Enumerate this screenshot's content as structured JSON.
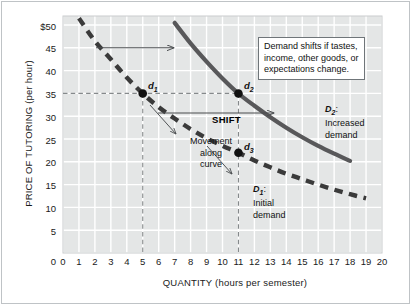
{
  "chart_data": {
    "type": "line",
    "title": "",
    "xlabel": "QUANTITY (hours per semester)",
    "ylabel": "PRICE OF TUTORING (per hour)",
    "xlim": [
      0,
      20
    ],
    "ylim": [
      0,
      52
    ],
    "grid": true,
    "legend_position": "inline-annotations",
    "xticks": [
      "0",
      "1",
      "2",
      "3",
      "4",
      "5",
      "6",
      "7",
      "8",
      "9",
      "10",
      "11",
      "12",
      "13",
      "14",
      "15",
      "16",
      "17",
      "18",
      "19",
      "20"
    ],
    "yticks": [
      "0",
      "5",
      "10",
      "15",
      "20",
      "25",
      "30",
      "35",
      "40",
      "45",
      "$50"
    ],
    "series": [
      {
        "name": "D1: Initial demand",
        "style": "dashed",
        "color": "#3a3a3a",
        "x": [
          1,
          2,
          3,
          4,
          5,
          6,
          7,
          8,
          9,
          10,
          11,
          12,
          13,
          14,
          15,
          16,
          17,
          18,
          19
        ],
        "y": [
          51.5,
          46.5,
          42.5,
          38.5,
          35.0,
          32.0,
          29.5,
          27.2,
          25.2,
          23.5,
          22.0,
          20.3,
          18.8,
          17.4,
          16.2,
          15.0,
          13.9,
          12.9,
          12.0
        ]
      },
      {
        "name": "D2: Increased demand",
        "style": "solid",
        "color": "#58585a",
        "x": [
          7,
          8,
          9,
          10,
          11,
          12,
          13,
          14,
          15,
          16,
          17,
          18
        ],
        "y": [
          50.5,
          46.0,
          42.0,
          38.3,
          35.0,
          32.3,
          29.8,
          27.5,
          25.4,
          23.5,
          21.8,
          20.2
        ]
      }
    ],
    "points": [
      {
        "id": "d1",
        "label": "d",
        "sub": "1",
        "x": 5,
        "y": 35
      },
      {
        "id": "d2",
        "label": "d",
        "sub": "2",
        "x": 11,
        "y": 35
      },
      {
        "id": "d3",
        "label": "d",
        "sub": "3",
        "x": 11,
        "y": 22
      }
    ],
    "guide_lines": [
      {
        "type": "horizontal",
        "y": 35,
        "from_x": 0,
        "to_x": 11
      },
      {
        "type": "vertical",
        "x": 5,
        "from_y": 0,
        "to_y": 35
      },
      {
        "type": "vertical",
        "x": 11,
        "from_y": 0,
        "to_y": 35
      }
    ],
    "annotations": [
      {
        "id": "callout",
        "text_lines": [
          "Demand shifts if tastes,",
          "income, other goods, or",
          "expectations change."
        ]
      },
      {
        "id": "shift",
        "text": "SHIFT"
      },
      {
        "id": "movement",
        "text_lines": [
          "Movement",
          "along",
          "curve"
        ]
      },
      {
        "id": "d2-label",
        "name": "D",
        "sub": "2",
        "text_lines": [
          "Increased",
          "demand"
        ]
      },
      {
        "id": "d1-label",
        "name": "D",
        "sub": "1",
        "text_lines": [
          "Initial",
          "demand"
        ]
      }
    ],
    "arrows": [
      {
        "id": "top-shift-arrow",
        "from": [
          2.1,
          47.8
        ],
        "to": [
          7.1,
          47.8
        ]
      },
      {
        "id": "shift-arrow",
        "from": [
          6.0,
          30.6
        ],
        "to": [
          13.2,
          30.6
        ]
      },
      {
        "id": "movement-arrow",
        "from": [
          5.4,
          32.3
        ],
        "to": [
          7.2,
          26.0
        ]
      },
      {
        "id": "movement-arrow-2",
        "from": [
          9.7,
          24.4
        ],
        "to": [
          12.3,
          19.3
        ]
      }
    ],
    "colors": {
      "plot_background": "#e4e6e6",
      "gridline": "#ffffff",
      "d1_curve": "#3a3a3a",
      "d2_curve": "#58585a",
      "point_marker": "#111111",
      "guide_line": "#8a8d8f",
      "frame": "#bfc3c6",
      "text": "#111111"
    }
  },
  "axes": {
    "y_title": "PRICE OF TUTORING (per hour)",
    "x_title": "QUANTITY (hours per semester)",
    "y_ticks": [
      "$50",
      "45",
      "40",
      "35",
      "30",
      "25",
      "20",
      "15",
      "10",
      "5",
      "0"
    ],
    "x_ticks": [
      "0",
      "1",
      "2",
      "3",
      "4",
      "5",
      "6",
      "7",
      "8",
      "9",
      "10",
      "11",
      "12",
      "13",
      "14",
      "15",
      "16",
      "17",
      "18",
      "19",
      "20"
    ]
  },
  "callout": {
    "line1": "Demand shifts if tastes,",
    "line2": "income, other goods, or",
    "line3": "expectations change."
  },
  "labels": {
    "shift": "SHIFT",
    "movement_line1": "Movement",
    "movement_line2": "along",
    "movement_line3": "curve",
    "d2_name": "D",
    "d2_sub": "2",
    "d2_colon": ":",
    "d2_line1": "Increased",
    "d2_line2": "demand",
    "d1_name": "D",
    "d1_sub": "1",
    "d1_colon": ":",
    "d1_line1": "Initial",
    "d1_line2": "demand",
    "pt_d1": "d",
    "pt_d1_sub": "1",
    "pt_d2": "d",
    "pt_d2_sub": "2",
    "pt_d3": "d",
    "pt_d3_sub": "3"
  }
}
